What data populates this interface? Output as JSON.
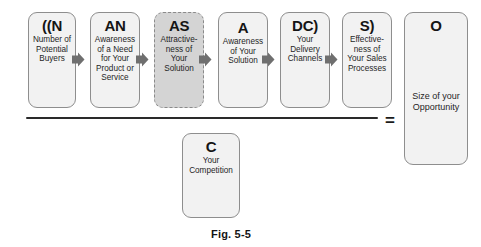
{
  "figure": {
    "caption": "Fig. 5-5",
    "equals_symbol": "=",
    "numerator_nodes": [
      {
        "code": "((N",
        "desc": "Number of\nPotential\nBuyers",
        "style": "solid",
        "x": 28,
        "y": 12,
        "w": 48,
        "h": 96
      },
      {
        "code": "AN",
        "desc": "Awareness\nof a Need\nfor Your\nProduct or\nService",
        "style": "solid",
        "x": 90,
        "y": 12,
        "w": 50,
        "h": 96
      },
      {
        "code": "AS",
        "desc": "Attractive-\nness of\nYour\nSolution",
        "style": "dashed",
        "x": 154,
        "y": 12,
        "w": 50,
        "h": 96
      },
      {
        "code": "A",
        "desc": "Awareness\nof Your\nSolution",
        "style": "solid",
        "x": 218,
        "y": 12,
        "w": 50,
        "h": 96
      },
      {
        "code": "DC)",
        "desc": "Your\nDelivery\nChannels",
        "style": "solid",
        "x": 280,
        "y": 12,
        "w": 50,
        "h": 96
      },
      {
        "code": "S)",
        "desc": "Effective-\nness of\nYour Sales\nProcesses",
        "style": "solid",
        "x": 342,
        "y": 12,
        "w": 50,
        "h": 96
      }
    ],
    "denominator_node": {
      "code": "C",
      "desc": "Your\nCompetition",
      "style": "solid",
      "x": 182,
      "y": 133,
      "w": 58,
      "h": 85
    },
    "result_node": {
      "code": "O",
      "desc": "Size of your\nOpportunity",
      "style": "solid",
      "x": 404,
      "y": 12,
      "w": 64,
      "h": 153
    },
    "connectors": [
      {
        "name": "connector-n-to-an",
        "x": 72,
        "y": 52
      },
      {
        "name": "connector-an-to-as",
        "x": 136,
        "y": 52
      },
      {
        "name": "connector-as-to-a",
        "x": 199,
        "y": 52
      },
      {
        "name": "connector-a-to-dc",
        "x": 262,
        "y": 52
      },
      {
        "name": "connector-dc-to-s",
        "x": 325,
        "y": 52
      }
    ],
    "fraction_bar": {
      "x": 26,
      "y": 117,
      "w": 352
    },
    "equals_pos": {
      "x": 385,
      "y": 112
    },
    "caption_pos": {
      "x": 211,
      "y": 228
    },
    "colors": {
      "node_fill": "#f2f2f2",
      "node_highlight_fill": "#d4d4d4",
      "node_border": "#8e8e8e",
      "connector": "#6f6f6f",
      "bar": "#2a2a2a"
    }
  }
}
